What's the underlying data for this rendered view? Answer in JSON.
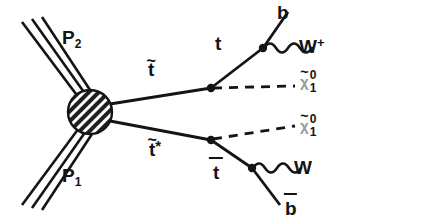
{
  "diagram": {
    "type": "feynman-diagram",
    "background_color": "#ffffff",
    "line_color": "#141414",
    "blob_color": "#2b2b2b",
    "labels": {
      "proton_top": "P",
      "proton_top_index": "2",
      "proton_bottom": "P",
      "proton_bottom_index": "1",
      "stop_upper": "t",
      "stop_upper_tilde": "~",
      "stop_lower": "t",
      "stop_lower_tilde": "~",
      "stop_lower_star": "*",
      "top_quark": "t",
      "antitop_quark": "t",
      "b_quark": "b",
      "antib_quark": "b",
      "w_plus": "W",
      "w_plus_charge": "+",
      "w_minus": "W",
      "neutralino_chi": "χ",
      "neutralino_tilde": "~",
      "neutralino_sup": "0",
      "neutralino_sub": "1"
    },
    "nodes": {
      "hard_scatter_blob": {
        "x": 90,
        "y": 112,
        "r": 22
      },
      "upper_stop_vertex": {
        "x": 211,
        "y": 88
      },
      "upper_top_vertex": {
        "x": 263,
        "y": 48
      },
      "lower_stop_vertex": {
        "x": 211,
        "y": 140
      },
      "lower_top_vertex": {
        "x": 252,
        "y": 168
      }
    },
    "edges": [
      {
        "name": "proton-2-beam",
        "style": "triple-line",
        "label": "P2"
      },
      {
        "name": "proton-1-beam",
        "style": "triple-line",
        "label": "P1"
      },
      {
        "name": "stop-upper",
        "style": "solid",
        "label": "t-tilde"
      },
      {
        "name": "stop-lower",
        "style": "solid",
        "label": "t-tilde-star"
      },
      {
        "name": "top-quark",
        "style": "solid",
        "label": "t"
      },
      {
        "name": "antitop-quark",
        "style": "solid",
        "label": "t-bar"
      },
      {
        "name": "b-quark",
        "style": "solid",
        "label": "b"
      },
      {
        "name": "antib-quark",
        "style": "solid",
        "label": "b-bar"
      },
      {
        "name": "w-plus-boson",
        "style": "wavy",
        "label": "W+"
      },
      {
        "name": "w-minus-boson",
        "style": "wavy",
        "label": "W"
      },
      {
        "name": "neutralino-upper",
        "style": "dashed",
        "label": "chi-0-1"
      },
      {
        "name": "neutralino-lower",
        "style": "dashed",
        "label": "chi-0-1"
      }
    ]
  }
}
